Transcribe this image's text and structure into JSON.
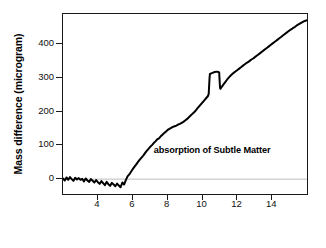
{
  "chart_data": {
    "type": "line",
    "title": "",
    "xlabel": "Time (day)",
    "ylabel": "Mass difference (microgram)",
    "xlim": [
      2.0,
      16.1
    ],
    "ylim": [
      -50,
      490
    ],
    "xticks": [
      4,
      6,
      8,
      10,
      12,
      14
    ],
    "yticks": [
      0,
      100,
      200,
      300,
      400
    ],
    "grid": false,
    "legend": null,
    "annotations": [
      {
        "text": "absorption of Subtle Matter",
        "x": 10.6,
        "y": 80
      }
    ],
    "reference_lines": [
      {
        "axis": "y",
        "value": 0,
        "color": "#bdbdbd"
      }
    ],
    "series": [
      {
        "name": "Mass difference",
        "color": "#000000",
        "linewidth": 2.0,
        "x": [
          2.0,
          2.1,
          2.2,
          2.3,
          2.4,
          2.5,
          2.6,
          2.7,
          2.8,
          2.9,
          3.0,
          3.1,
          3.2,
          3.3,
          3.4,
          3.5,
          3.6,
          3.7,
          3.8,
          3.9,
          4.0,
          4.1,
          4.2,
          4.3,
          4.4,
          4.5,
          4.6,
          4.7,
          4.8,
          4.9,
          5.0,
          5.1,
          5.2,
          5.3,
          5.4,
          5.5,
          5.6,
          5.7,
          5.8,
          5.9,
          6.0,
          6.1,
          6.2,
          6.3,
          6.4,
          6.5,
          6.6,
          6.7,
          6.8,
          6.9,
          7.0,
          7.1,
          7.2,
          7.3,
          7.4,
          7.5,
          7.6,
          7.7,
          7.8,
          7.9,
          8.0,
          8.1,
          8.2,
          8.3,
          8.4,
          8.5,
          8.6,
          8.7,
          8.8,
          8.9,
          9.0,
          9.1,
          9.2,
          9.3,
          9.4,
          9.5,
          9.6,
          9.7,
          9.8,
          9.9,
          10.0,
          10.1,
          10.2,
          10.3,
          10.35,
          10.4,
          10.42,
          10.5,
          10.6,
          10.7,
          10.8,
          10.9,
          10.95,
          11.0,
          11.02,
          11.1,
          11.2,
          11.3,
          11.4,
          11.5,
          11.6,
          11.7,
          11.8,
          11.9,
          12.0,
          12.1,
          12.2,
          12.3,
          12.4,
          12.5,
          12.6,
          12.7,
          12.8,
          12.9,
          13.0,
          13.1,
          13.2,
          13.3,
          13.4,
          13.5,
          13.6,
          13.7,
          13.8,
          13.9,
          14.0,
          14.1,
          14.2,
          14.3,
          14.4,
          14.5,
          14.6,
          14.7,
          14.8,
          14.9,
          15.0,
          15.1,
          15.2,
          15.3,
          15.4,
          15.5,
          15.6,
          15.7,
          15.8,
          15.9,
          16.0,
          16.1
        ],
        "y": [
          2,
          -4,
          5,
          -2,
          6,
          0,
          -5,
          4,
          -1,
          3,
          -2,
          1,
          -7,
          2,
          -4,
          -8,
          0,
          -5,
          -10,
          -3,
          -9,
          -14,
          -6,
          -12,
          -18,
          -8,
          -15,
          -20,
          -11,
          -16,
          -21,
          -13,
          -19,
          -24,
          -10,
          -16,
          -3,
          8,
          14,
          22,
          30,
          37,
          44,
          51,
          58,
          64,
          70,
          77,
          84,
          90,
          96,
          101,
          107,
          112,
          118,
          121,
          127,
          132,
          137,
          141,
          146,
          149,
          152,
          155,
          157,
          159,
          162,
          164,
          167,
          170,
          174,
          178,
          183,
          188,
          193,
          198,
          203,
          210,
          216,
          222,
          228,
          234,
          240,
          246,
          252,
          300,
          312,
          314,
          316,
          318,
          319,
          318,
          317,
          272,
          268,
          274,
          281,
          288,
          295,
          301,
          307,
          312,
          316,
          320,
          324,
          328,
          332,
          336,
          340,
          344,
          347,
          351,
          355,
          358,
          362,
          366,
          370,
          374,
          378,
          382,
          386,
          390,
          394,
          398,
          402,
          406,
          410,
          414,
          418,
          422,
          426,
          430,
          434,
          438,
          442,
          445,
          449,
          452,
          456,
          459,
          462,
          465,
          468,
          470,
          472,
          474
        ]
      }
    ]
  },
  "axes": {
    "y_title": "Mass difference (microgram)",
    "x_title": "Time (day)",
    "y_tick_labels": [
      "400",
      "300",
      "200",
      "100",
      "0"
    ],
    "x_tick_labels": [
      "4",
      "6",
      "8",
      "10",
      "12",
      "14"
    ]
  },
  "annotation": {
    "text": "absorption of Subtle Matter"
  },
  "colors": {
    "line": "#000000",
    "frame": "#1a1a1a",
    "reference_line": "#bdbdbd",
    "background": "#ffffff"
  }
}
